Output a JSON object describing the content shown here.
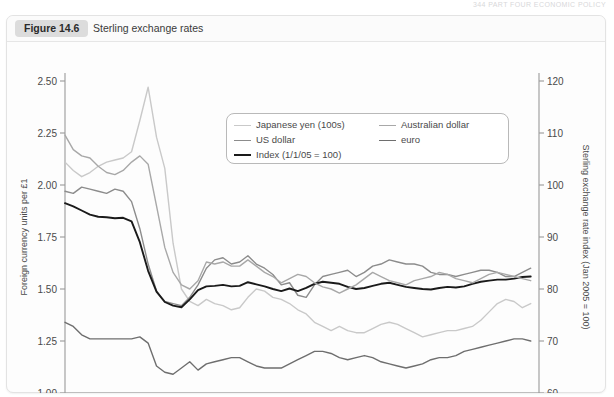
{
  "page": {
    "running_head": "344  PART FOUR  ECONOMIC POLICY"
  },
  "figure": {
    "badge": "Figure 14.6",
    "title": "Sterling exchange rates"
  },
  "chart_data": {
    "type": "line",
    "title": "Sterling exchange rates",
    "xlabel": "",
    "ylabel": "Foreign currency units per £1",
    "y2label": "Sterling exchange rate index (Jan 2005 = 100)",
    "grid": false,
    "legend_position": "top-right-inside",
    "xlim": [
      2008.0,
      2012.75
    ],
    "ylim": [
      1.0,
      2.5
    ],
    "y2lim": [
      60,
      120
    ],
    "yticks": [
      "1.00",
      "1.25",
      "1.50",
      "1.75",
      "2.00",
      "2.25",
      "2.50"
    ],
    "ytick_values": [
      1.0,
      1.25,
      1.5,
      1.75,
      2.0,
      2.25,
      2.5
    ],
    "y2ticks": [
      "60",
      "70",
      "80",
      "90",
      "100",
      "110",
      "120"
    ],
    "y2tick_values": [
      60,
      70,
      80,
      90,
      100,
      110,
      120
    ],
    "xticks": [
      "2008",
      "2009",
      "2010",
      "2011",
      "2012"
    ],
    "xtick_values": [
      2008,
      2009,
      2010,
      2011,
      2012
    ],
    "x_minor_step": 0.25,
    "colors": {
      "japanese_yen": "#c9c9c9",
      "us_dollar": "#8c8c8c",
      "index": "#1a1a1a",
      "australian_dollar": "#a8a8a8",
      "euro": "#6e6e6e"
    },
    "x": [
      2008.0,
      2008.083,
      2008.167,
      2008.25,
      2008.333,
      2008.417,
      2008.5,
      2008.583,
      2008.667,
      2008.75,
      2008.833,
      2008.917,
      2009.0,
      2009.083,
      2009.167,
      2009.25,
      2009.333,
      2009.417,
      2009.5,
      2009.583,
      2009.667,
      2009.75,
      2009.833,
      2009.917,
      2010.0,
      2010.083,
      2010.167,
      2010.25,
      2010.333,
      2010.417,
      2010.5,
      2010.583,
      2010.667,
      2010.75,
      2010.833,
      2010.917,
      2011.0,
      2011.083,
      2011.167,
      2011.25,
      2011.333,
      2011.417,
      2011.5,
      2011.583,
      2011.667,
      2011.75,
      2011.833,
      2011.917,
      2012.0,
      2012.083,
      2012.167,
      2012.25,
      2012.333,
      2012.417,
      2012.5,
      2012.583,
      2012.667
    ],
    "series": [
      {
        "name": "Japanese yen (100s)",
        "axis": "left",
        "color": "#c9c9c9",
        "values": [
          2.11,
          2.07,
          2.04,
          2.06,
          2.09,
          2.11,
          2.12,
          2.13,
          2.16,
          2.31,
          2.47,
          2.23,
          2.08,
          1.72,
          1.5,
          1.44,
          1.42,
          1.45,
          1.43,
          1.42,
          1.4,
          1.41,
          1.46,
          1.5,
          1.49,
          1.46,
          1.45,
          1.43,
          1.4,
          1.38,
          1.34,
          1.32,
          1.3,
          1.32,
          1.3,
          1.29,
          1.29,
          1.31,
          1.33,
          1.34,
          1.33,
          1.31,
          1.29,
          1.27,
          1.28,
          1.29,
          1.3,
          1.3,
          1.31,
          1.32,
          1.35,
          1.39,
          1.43,
          1.45,
          1.44,
          1.41,
          1.43
        ]
      },
      {
        "name": "US dollar",
        "axis": "left",
        "color": "#8c8c8c",
        "values": [
          1.97,
          1.96,
          1.99,
          1.98,
          1.97,
          1.96,
          1.98,
          1.97,
          1.92,
          1.79,
          1.62,
          1.49,
          1.44,
          1.43,
          1.42,
          1.46,
          1.52,
          1.6,
          1.64,
          1.65,
          1.62,
          1.63,
          1.66,
          1.62,
          1.6,
          1.57,
          1.52,
          1.53,
          1.47,
          1.46,
          1.52,
          1.56,
          1.57,
          1.58,
          1.59,
          1.56,
          1.58,
          1.61,
          1.62,
          1.64,
          1.63,
          1.62,
          1.62,
          1.61,
          1.58,
          1.57,
          1.57,
          1.56,
          1.57,
          1.58,
          1.59,
          1.59,
          1.58,
          1.56,
          1.56,
          1.58,
          1.6
        ]
      },
      {
        "name": "Index (1/1/05 = 100)",
        "axis": "right",
        "color": "#1a1a1a",
        "values": [
          96.5,
          95.9,
          95.1,
          94.3,
          93.9,
          93.8,
          93.6,
          93.7,
          93.0,
          89.0,
          83.5,
          79.5,
          77.5,
          76.8,
          76.5,
          78.0,
          79.8,
          80.5,
          80.6,
          80.8,
          80.5,
          80.6,
          81.3,
          80.9,
          80.5,
          80.0,
          79.6,
          80.1,
          79.6,
          80.2,
          81.0,
          81.4,
          81.2,
          81.0,
          80.4,
          80.0,
          80.2,
          80.6,
          81.0,
          81.2,
          80.8,
          80.4,
          80.2,
          80.0,
          79.9,
          80.2,
          80.4,
          80.3,
          80.5,
          81.0,
          81.4,
          81.6,
          81.8,
          81.8,
          82.0,
          82.3,
          82.4
        ]
      },
      {
        "name": "Australian dollar",
        "axis": "left",
        "color": "#a8a8a8",
        "values": [
          2.24,
          2.17,
          2.14,
          2.13,
          2.09,
          2.06,
          2.05,
          2.07,
          2.11,
          2.14,
          2.1,
          1.9,
          1.7,
          1.58,
          1.52,
          1.5,
          1.54,
          1.63,
          1.62,
          1.63,
          1.61,
          1.61,
          1.64,
          1.61,
          1.58,
          1.56,
          1.53,
          1.55,
          1.57,
          1.56,
          1.53,
          1.51,
          1.5,
          1.48,
          1.5,
          1.52,
          1.55,
          1.58,
          1.56,
          1.54,
          1.53,
          1.52,
          1.54,
          1.55,
          1.56,
          1.58,
          1.57,
          1.55,
          1.54,
          1.53,
          1.55,
          1.57,
          1.58,
          1.57,
          1.56,
          1.55,
          1.54
        ]
      },
      {
        "name": "euro",
        "axis": "left",
        "color": "#6e6e6e",
        "values": [
          1.34,
          1.32,
          1.28,
          1.26,
          1.26,
          1.26,
          1.26,
          1.26,
          1.26,
          1.27,
          1.24,
          1.13,
          1.1,
          1.09,
          1.12,
          1.15,
          1.11,
          1.14,
          1.15,
          1.16,
          1.17,
          1.17,
          1.15,
          1.13,
          1.12,
          1.12,
          1.12,
          1.14,
          1.16,
          1.18,
          1.2,
          1.2,
          1.19,
          1.17,
          1.16,
          1.17,
          1.18,
          1.17,
          1.15,
          1.14,
          1.13,
          1.12,
          1.13,
          1.14,
          1.16,
          1.17,
          1.17,
          1.18,
          1.2,
          1.21,
          1.22,
          1.23,
          1.24,
          1.25,
          1.26,
          1.26,
          1.25
        ]
      }
    ]
  },
  "legend": {
    "items_left": [
      {
        "label": "Japanese yen (100s)",
        "color": "#c9c9c9",
        "width": 1.6
      },
      {
        "label": "US dollar",
        "color": "#8c8c8c",
        "width": 1.8
      },
      {
        "label": "Index (1/1/05 = 100)",
        "color": "#1a1a1a",
        "width": 2.2
      }
    ],
    "items_right": [
      {
        "label": "Australian dollar",
        "color": "#a8a8a8",
        "width": 1.6
      },
      {
        "label": "euro",
        "color": "#6e6e6e",
        "width": 1.8
      }
    ]
  }
}
